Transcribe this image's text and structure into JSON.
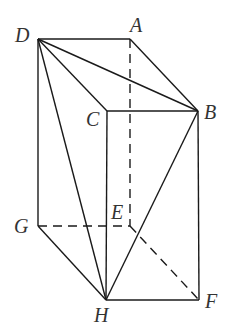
{
  "figure": {
    "type": "3D prism diagram",
    "colors": {
      "line": "#1a1a1a",
      "label": "#333333",
      "background": "#ffffff"
    },
    "vertices": {
      "D": {
        "label": "D",
        "x": 38,
        "y": 39,
        "lx": 15,
        "ly": 42
      },
      "A": {
        "label": "A",
        "x": 130,
        "y": 39,
        "lx": 130,
        "ly": 32
      },
      "C": {
        "label": "C",
        "x": 107,
        "y": 111,
        "lx": 86,
        "ly": 126
      },
      "B": {
        "label": "B",
        "x": 198,
        "y": 111,
        "lx": 204,
        "ly": 119
      },
      "G": {
        "label": "G",
        "x": 38,
        "y": 226,
        "lx": 14,
        "ly": 233
      },
      "E": {
        "label": "E",
        "x": 130,
        "y": 226,
        "lx": 111,
        "ly": 219
      },
      "H": {
        "label": "H",
        "x": 106,
        "y": 300,
        "lx": 94,
        "ly": 322
      },
      "F": {
        "label": "F",
        "x": 199,
        "y": 300,
        "lx": 205,
        "ly": 308
      }
    },
    "solid_edges": [
      [
        "D",
        "A"
      ],
      [
        "A",
        "B"
      ],
      [
        "D",
        "C"
      ],
      [
        "C",
        "B"
      ],
      [
        "D",
        "B"
      ],
      [
        "D",
        "G"
      ],
      [
        "D",
        "H"
      ],
      [
        "C",
        "H"
      ],
      [
        "B",
        "H"
      ],
      [
        "B",
        "F"
      ],
      [
        "G",
        "H"
      ],
      [
        "H",
        "F"
      ]
    ],
    "dashed_edges": [
      [
        "A",
        "E"
      ],
      [
        "G",
        "E"
      ],
      [
        "E",
        "F"
      ]
    ]
  }
}
